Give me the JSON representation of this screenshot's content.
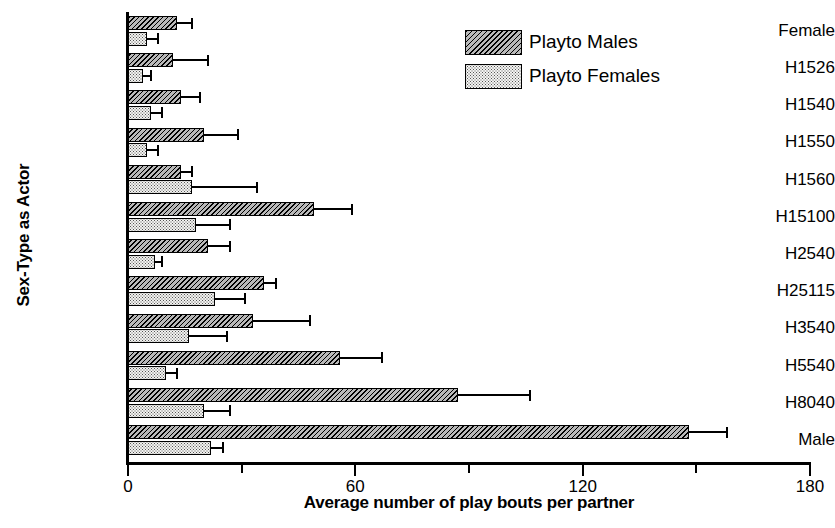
{
  "chart_data": {
    "type": "bar",
    "orientation": "horizontal",
    "title": "",
    "xlabel": "Average number of play bouts per partner",
    "ylabel": "Sex-Type as Actor",
    "xlim": [
      0,
      180
    ],
    "xticks": [
      0,
      60,
      120,
      180
    ],
    "xtick_labels": [
      "0",
      "60",
      "120",
      "180"
    ],
    "xminorticks": [
      30,
      90,
      150
    ],
    "grid": false,
    "legend_position": "top-right",
    "categories": [
      "Female",
      "H1526",
      "H1540",
      "H1550",
      "H1560",
      "H15100",
      "H2540",
      "H25115",
      "H3540",
      "H5540",
      "H8040",
      "Male"
    ],
    "series": [
      {
        "name": "Playto Males",
        "pattern": "diagonal-hatch",
        "values": [
          13,
          12,
          14,
          20,
          14,
          49,
          21,
          36,
          33,
          56,
          87,
          148
        ],
        "errors_upper": [
          17,
          21,
          19,
          29,
          17,
          59,
          27,
          39,
          48,
          67,
          106,
          158
        ]
      },
      {
        "name": "Playto Females",
        "pattern": "stipple-dots",
        "values": [
          5,
          4,
          6,
          5,
          17,
          18,
          7,
          23,
          16,
          10,
          20,
          22
        ],
        "errors_upper": [
          8,
          6,
          9,
          8,
          34,
          27,
          9,
          31,
          26,
          13,
          27,
          25
        ]
      }
    ]
  },
  "legend": {
    "items": [
      {
        "label": "Playto Males"
      },
      {
        "label": "Playto Females"
      }
    ]
  },
  "colors": {
    "axis": "#000000",
    "males_fill": "#b9b9b9",
    "females_fill": "#f2f2f0",
    "background": "#ffffff"
  }
}
